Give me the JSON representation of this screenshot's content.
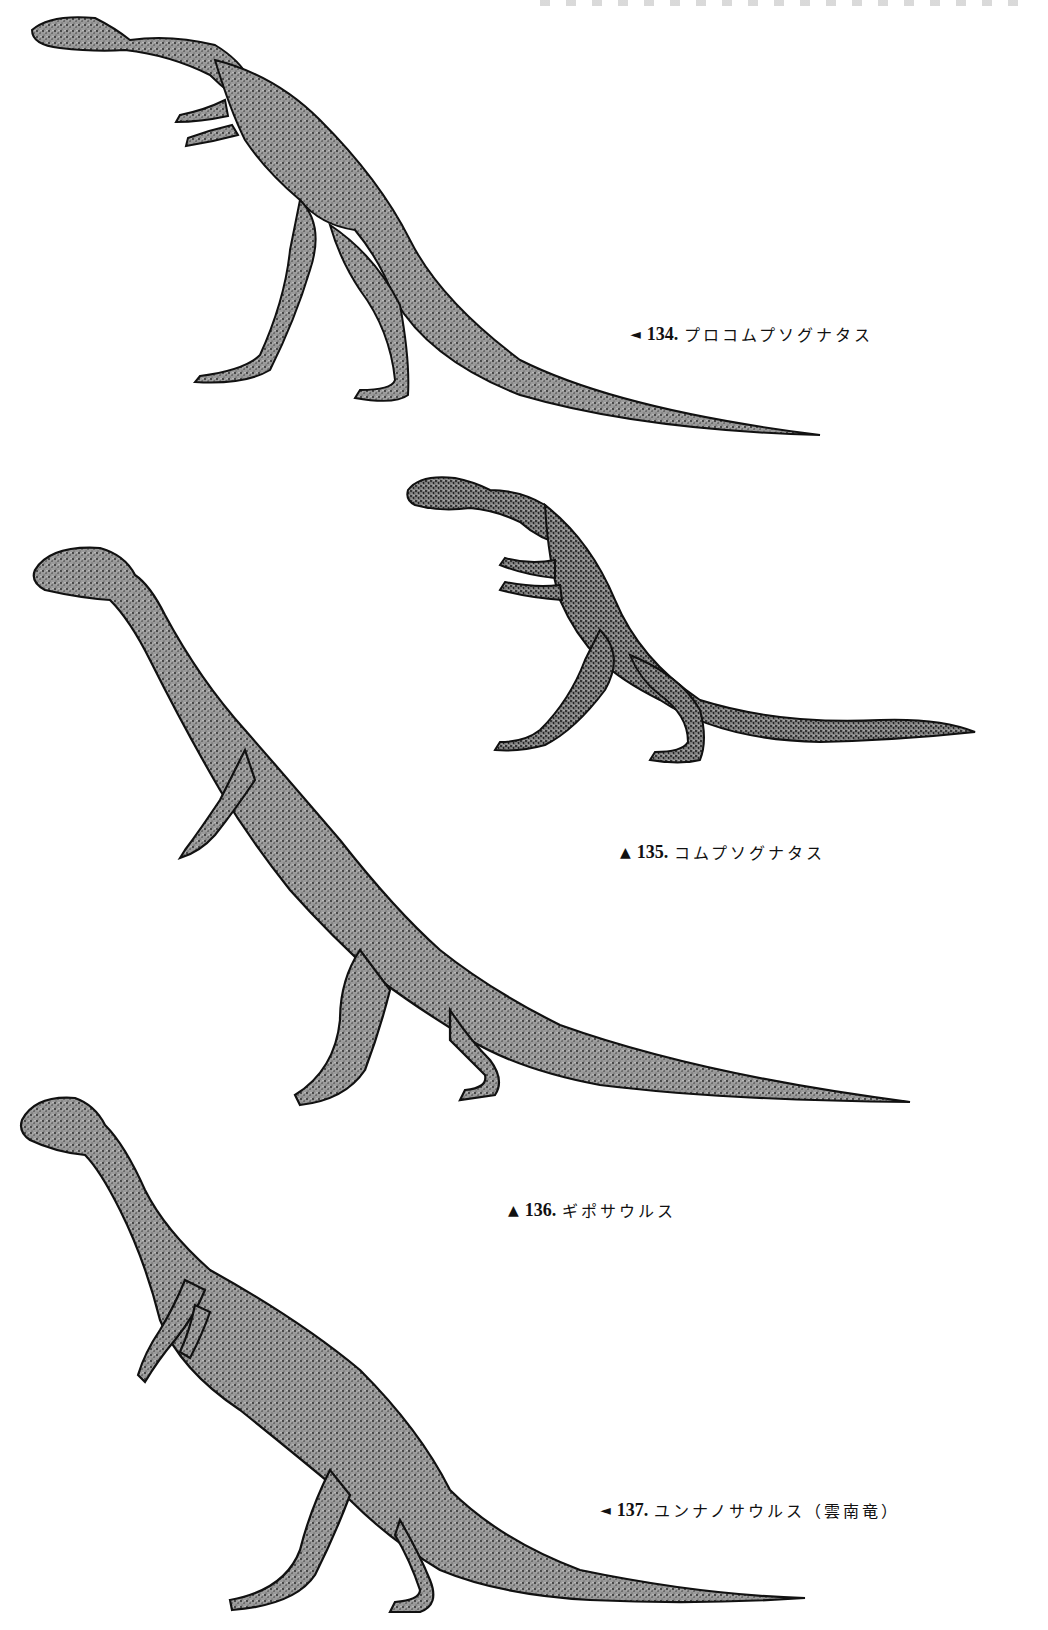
{
  "page": {
    "type": "book-illustration-plate",
    "header_visible": "partially cropped, illegible"
  },
  "figures": [
    {
      "number": "134.",
      "name": "プロコムプソグナタス",
      "pointer": "◄",
      "pointer_meaning": "left-arrow"
    },
    {
      "number": "135.",
      "name": "コムプソグナタス",
      "pointer": "▲",
      "pointer_meaning": "up-arrow"
    },
    {
      "number": "136.",
      "name": "ギポサウルス",
      "pointer": "▲",
      "pointer_meaning": "up-arrow"
    },
    {
      "number": "137.",
      "name": "ユンナノサウルス（雲南竜）",
      "pointer": "◄",
      "pointer_meaning": "left-arrow"
    }
  ],
  "colors": {
    "ink": "#111111",
    "stipple_fill": "#8a8a8a",
    "background": "#ffffff"
  }
}
